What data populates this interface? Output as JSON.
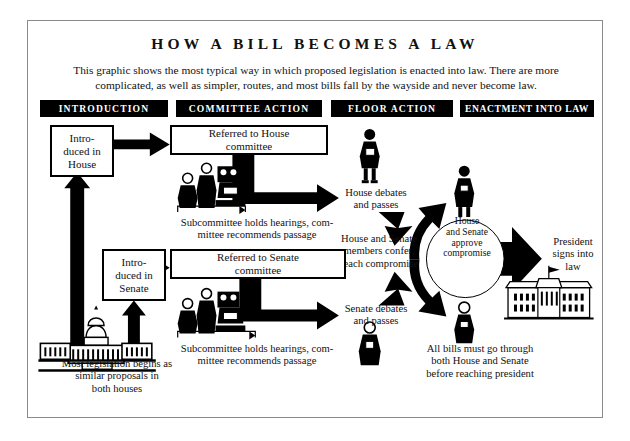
{
  "page": {
    "title": "HOW A BILL BECOMES A LAW",
    "subtitle": "This graphic shows the most typical way in which proposed legislation is enacted into law. There are more complicated, as well as simpler, routes, and most bills fall by the wayside and never become law."
  },
  "banners": [
    {
      "label": "INTRODUCTION"
    },
    {
      "label": "COMMITTEE ACTION"
    },
    {
      "label": "FLOOR ACTION"
    },
    {
      "label": "ENACTMENT INTO LAW"
    }
  ],
  "boxes": {
    "house_introduced": "Intro-\nduced in\nHouse",
    "house_referred": "Referred to House\ncommittee",
    "senate_introduced": "Intro-\nduced in\nSenate",
    "senate_referred": "Referred to Senate\ncommittee"
  },
  "labels": {
    "subcommittee_house": "Subcommittee holds hearings, com-\nmittee recommends passage",
    "subcommittee_senate": "Subcommittee holds hearings, com-\nmittee recommends passage",
    "house_debates": "House debates\nand passes",
    "senate_debates": "Senate debates\nand passes",
    "confer": "House and Senate\nmembers confer,\nreach compromise",
    "circle": "House\nand Senate\napprove\ncompromise",
    "president": "President\nsigns into\nlaw",
    "all_bills": "All bills must go through\nboth House and Senate\nbefore reaching president",
    "capitol": "Most legislation begins as\nsimilar proposals in\nboth houses"
  },
  "colors": {
    "ink": "#000000",
    "paper": "#ffffff",
    "frame": "#8a8a8a"
  },
  "icons": {
    "capitol": "capitol-building-icon",
    "white_house": "white-house-icon",
    "house_member": "person-speaker-icon",
    "senate_member": "person-speaker-icon",
    "conferee_top": "person-speaker-icon",
    "conferee_bottom": "person-speaker-icon",
    "committee_house": "committee-group-icon",
    "committee_senate": "committee-group-icon"
  }
}
